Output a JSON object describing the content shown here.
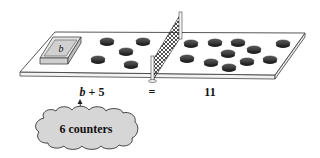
{
  "diagram": {
    "type": "balance-equation-illustration",
    "box_label": "b",
    "left_side": {
      "unknown_box": "b",
      "counter_count": 5
    },
    "right_side": {
      "counter_count": 11
    },
    "equation": {
      "left": "b + 5",
      "operator": "=",
      "right": "11"
    },
    "callout": {
      "text": "6 counters",
      "points_to": "b"
    },
    "colors": {
      "board": "#ffffff",
      "outline": "#333333",
      "box": "#d9d9d9",
      "counter": "#3a3a3a",
      "cloud": "#d6d6d6"
    }
  }
}
